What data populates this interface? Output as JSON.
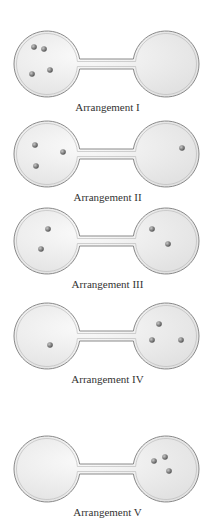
{
  "figure": {
    "colors": {
      "background": "#ffffff",
      "glass_fill": "#e2e2e2",
      "glass_highlight": "#fafafa",
      "glass_outline": "#8a8a8a",
      "molecule": "#555555",
      "molecule_highlight": "#c8c8c8",
      "caption_text": "#333333"
    },
    "arrangements": [
      {
        "label": "Arrangement I",
        "top": 28,
        "left_bulb_molecules": [
          [
            -13,
            -17
          ],
          [
            -3,
            -15
          ],
          [
            3,
            6
          ],
          [
            -15,
            10
          ]
        ],
        "right_bulb_molecules": []
      },
      {
        "label": "Arrangement II",
        "top": 118,
        "left_bulb_molecules": [
          [
            -12,
            -9
          ],
          [
            16,
            -2
          ],
          [
            -11,
            12
          ]
        ],
        "right_bulb_molecules": [
          [
            16,
            -6
          ]
        ]
      },
      {
        "label": "Arrangement III",
        "top": 205,
        "left_bulb_molecules": [
          [
            1,
            -12
          ],
          [
            -6,
            8
          ]
        ],
        "right_bulb_molecules": [
          [
            -14,
            -12
          ],
          [
            2,
            3
          ]
        ]
      },
      {
        "label": "Arrangement IV",
        "top": 300,
        "left_bulb_molecules": [
          [
            3,
            9
          ]
        ],
        "right_bulb_molecules": [
          [
            -7,
            -12
          ],
          [
            -14,
            4
          ],
          [
            15,
            4
          ]
        ]
      },
      {
        "label": "Arrangement V",
        "top": 433,
        "left_bulb_molecules": [],
        "right_bulb_molecules": [
          [
            -12,
            -8
          ],
          [
            -1,
            -12
          ],
          [
            3,
            2
          ]
        ]
      }
    ]
  }
}
